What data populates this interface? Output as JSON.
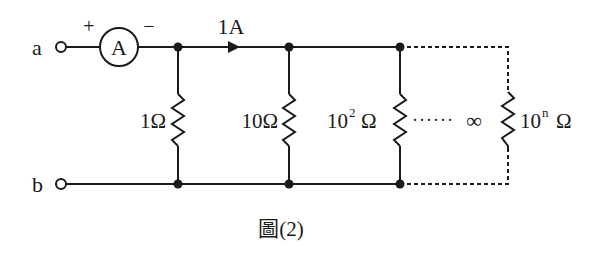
{
  "diagram": {
    "terminals": {
      "a": "a",
      "b": "b"
    },
    "ammeter": {
      "symbol": "A",
      "plus": "+",
      "minus": "−"
    },
    "current_label": "1A",
    "resistors": [
      {
        "label": "1Ω"
      },
      {
        "label": "10Ω"
      },
      {
        "base": "10",
        "exp": "2",
        "unit": "Ω"
      },
      {
        "base": "10",
        "exp": "n",
        "unit": "Ω"
      }
    ],
    "ellipsis": "······",
    "infinity": "∞",
    "caption": "圖(2)"
  }
}
